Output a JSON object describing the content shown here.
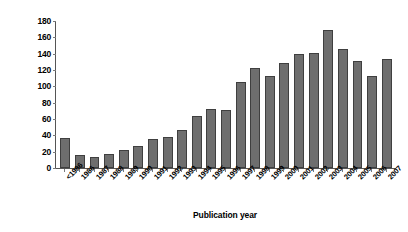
{
  "chart_data": {
    "type": "bar",
    "title": "",
    "xlabel": "Publication year",
    "ylabel": "No. of clinical studies",
    "ylim": [
      0,
      180
    ],
    "ytick_step": 20,
    "yticks": [
      180,
      160,
      140,
      120,
      100,
      80,
      60,
      40,
      20,
      0
    ],
    "grid": false,
    "legend": "none",
    "bar_color": "#6e6e6e",
    "bar_edge_color": "#3f3f3f",
    "axis_color": "#555555",
    "background_color": "#ffffff",
    "categories": [
      "<1986",
      "1986",
      "1987",
      "1988",
      "1989",
      "1990",
      "1991",
      "1992",
      "1993",
      "1994",
      "1995",
      "1996",
      "1997",
      "1998",
      "1999",
      "2000",
      "2001",
      "2002",
      "2003",
      "2004",
      "2005",
      "2006",
      "2007"
    ],
    "values": [
      37,
      16,
      13,
      17,
      22,
      27,
      35,
      38,
      46,
      64,
      72,
      71,
      105,
      123,
      113,
      128,
      140,
      141,
      169,
      146,
      131,
      113,
      134
    ]
  }
}
